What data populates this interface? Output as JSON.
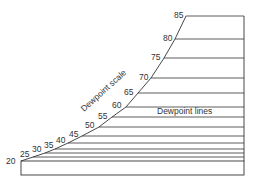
{
  "diagram": {
    "scale_label": "Dewpoint scale",
    "lines_label": "Dewpoint lines",
    "line_color": "#333333",
    "right_edge_x": 244,
    "bottom_rect": {
      "x": 21,
      "y": 161,
      "width": 223,
      "height": 14
    },
    "ticks": [
      {
        "value": "85",
        "x": 186,
        "y": 16,
        "lx": 174,
        "ly": 18
      },
      {
        "value": "80",
        "x": 175,
        "y": 39,
        "lx": 163,
        "ly": 41
      },
      {
        "value": "75",
        "x": 164,
        "y": 58,
        "lx": 151,
        "ly": 60
      },
      {
        "value": "70",
        "x": 151,
        "y": 78,
        "lx": 139,
        "ly": 80
      },
      {
        "value": "65",
        "x": 138,
        "y": 93,
        "lx": 124,
        "ly": 95
      },
      {
        "value": "60",
        "x": 126,
        "y": 107,
        "lx": 112,
        "ly": 108
      },
      {
        "value": "55",
        "x": 112,
        "y": 117,
        "lx": 98,
        "ly": 119
      },
      {
        "value": "50",
        "x": 99,
        "y": 127,
        "lx": 85,
        "ly": 128
      },
      {
        "value": "45",
        "x": 82,
        "y": 136,
        "lx": 69,
        "ly": 137
      },
      {
        "value": "40",
        "x": 68,
        "y": 143,
        "lx": 56,
        "ly": 143
      },
      {
        "value": "35",
        "x": 55,
        "y": 149,
        "lx": 44,
        "ly": 148
      },
      {
        "value": "30",
        "x": 45,
        "y": 153,
        "lx": 32,
        "ly": 152
      },
      {
        "value": "25",
        "x": 33,
        "y": 157,
        "lx": 20,
        "ly": 157
      },
      {
        "value": "20",
        "x": 21,
        "y": 161,
        "lx": 6,
        "ly": 164
      }
    ]
  }
}
